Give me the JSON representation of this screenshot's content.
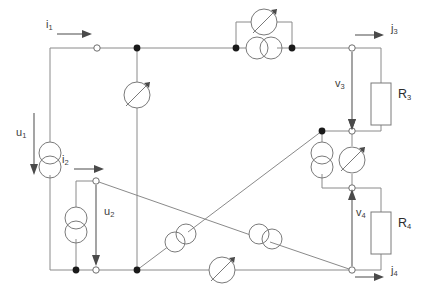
{
  "diagram": {
    "background_color": "#ffffff",
    "wire_color": "#8a8a8a",
    "label_color": "#3c3c3c"
  },
  "labels": {
    "i1": {
      "text": "i",
      "sub": "1",
      "x": 46,
      "y": 25
    },
    "i2": {
      "text": "i",
      "sub": "2",
      "x": 62,
      "y": 160
    },
    "u1": {
      "text": "u",
      "sub": "1",
      "x": 16,
      "y": 133
    },
    "u2": {
      "text": "u",
      "sub": "2",
      "x": 104,
      "y": 212
    },
    "j3": {
      "text": "j",
      "sub": "3",
      "x": 391,
      "y": 29
    },
    "j4": {
      "text": "j",
      "sub": "4",
      "x": 391,
      "y": 265
    },
    "v3": {
      "text": "v",
      "sub": "3",
      "x": 337,
      "y": 84
    },
    "v4": {
      "text": "v",
      "sub": "4",
      "x": 358,
      "y": 213
    },
    "r3": {
      "text": "R",
      "sub": "3",
      "x": 398,
      "y": 84
    },
    "r4": {
      "text": "R",
      "sub": "4",
      "x": 398,
      "y": 213
    }
  },
  "components": [
    {
      "name": "variable-element-top-middle",
      "kind": "variable",
      "x": 137,
      "y": 95
    },
    {
      "name": "variable-element-top-right-parallel",
      "kind": "variable",
      "x": 264,
      "y": 22
    },
    {
      "name": "source-top-right-parallel",
      "kind": "double-circle",
      "x": 264,
      "y": 48
    },
    {
      "name": "source-left-u1",
      "kind": "double-circle-vertical",
      "x": 50,
      "y": 160
    },
    {
      "name": "source-u2-branch",
      "kind": "double-circle-vertical",
      "x": 76,
      "y": 225
    },
    {
      "name": "source-right-vertical",
      "kind": "double-circle-vertical",
      "x": 322,
      "y": 160
    },
    {
      "name": "variable-element-right-middle",
      "kind": "variable",
      "x": 352,
      "y": 160
    },
    {
      "name": "source-diagonal-up",
      "kind": "double-circle-diagonal",
      "x": 180,
      "y": 238
    },
    {
      "name": "source-diagonal-down",
      "kind": "double-circle-diagonal",
      "x": 265,
      "y": 236
    },
    {
      "name": "variable-element-bottom",
      "kind": "variable",
      "x": 222,
      "y": 270
    },
    {
      "name": "resistor-r3",
      "kind": "resistor",
      "x": 381,
      "y": 95
    },
    {
      "name": "resistor-r4",
      "kind": "resistor",
      "x": 381,
      "y": 224
    }
  ],
  "nodes": [
    {
      "name": "node-open-top-left",
      "type": "open",
      "x": 97,
      "y": 48
    },
    {
      "name": "node-filled-top-middle",
      "type": "filled",
      "x": 137,
      "y": 48
    },
    {
      "name": "node-filled-top-right-a",
      "type": "filled",
      "x": 236,
      "y": 48
    },
    {
      "name": "node-filled-top-right-b",
      "type": "filled",
      "x": 292,
      "y": 48
    },
    {
      "name": "node-open-j3",
      "type": "open",
      "x": 352,
      "y": 48
    },
    {
      "name": "node-open-i2",
      "type": "open",
      "x": 96,
      "y": 181
    },
    {
      "name": "node-filled-right-upper",
      "type": "filled",
      "x": 322,
      "y": 131
    },
    {
      "name": "node-open-v3-bottom",
      "type": "open",
      "x": 352,
      "y": 131
    },
    {
      "name": "node-open-v4-top",
      "type": "open",
      "x": 352,
      "y": 188
    },
    {
      "name": "node-filled-bottom-u2",
      "type": "filled",
      "x": 76,
      "y": 270
    },
    {
      "name": "node-open-bottom-u2",
      "type": "open",
      "x": 96,
      "y": 270
    },
    {
      "name": "node-filled-bottom-middle",
      "type": "filled",
      "x": 137,
      "y": 270
    },
    {
      "name": "node-open-j4",
      "type": "open",
      "x": 352,
      "y": 270
    }
  ]
}
